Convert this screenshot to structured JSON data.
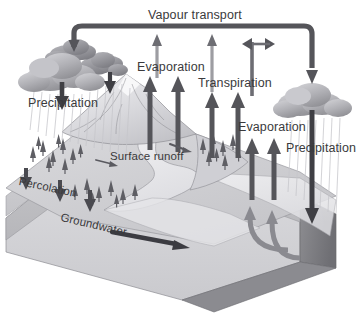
{
  "diagram": {
    "style": "grayscale-3d-block-landscape"
  },
  "labels": {
    "vapour_transport": "Vapour transport",
    "evaporation_left": "Evaporation",
    "transpiration": "Transpiration",
    "precipitation_left": "Precipitation",
    "evaporation_right": "Evaporation",
    "precipitation_right": "Precipitation",
    "surface_runoff": "Surface runoff",
    "percolation": "Percolation",
    "groundwater": "Groundwater"
  },
  "icons": {
    "cloud_left": "cloud-icon",
    "cloud_left_small_a": "cloud-icon",
    "cloud_left_small_b": "cloud-icon",
    "cloud_right": "cloud-icon",
    "mountain": "mountain-icon",
    "trees_left": "tree-cluster-icon",
    "trees_mid": "tree-cluster-icon",
    "trees_right": "tree-cluster-icon",
    "river": "river-icon",
    "terrain_block": "terrain-block-icon",
    "arrow_vapour_transport": "arrow-curved-right-icon",
    "arrow_evaporation_up_a": "arrow-up-icon",
    "arrow_evaporation_up_b": "arrow-up-icon",
    "arrow_transpiration_up_a": "arrow-up-icon",
    "arrow_transpiration_up_b": "arrow-up-icon",
    "arrow_exchange_bidirectional": "arrow-left-right-icon",
    "arrow_precipitation_down_a": "arrow-down-icon",
    "arrow_precipitation_down_b": "arrow-down-icon",
    "arrow_precipitation_down_right": "arrow-down-icon",
    "arrow_percolation_a": "arrow-down-icon",
    "arrow_percolation_b": "arrow-down-icon",
    "arrow_percolation_c": "arrow-down-icon",
    "arrow_groundwater_flow": "arrow-right-icon",
    "arrow_return_curve_a": "arrow-curved-up-icon",
    "arrow_return_curve_b": "arrow-curved-up-icon",
    "rain_streaks_left": "rain-icon",
    "rain_streaks_right": "rain-icon"
  },
  "colors": {
    "background": "#ffffff",
    "arrow_dark": "#55555a",
    "arrow_mid": "#7f7f84",
    "arrow_light": "#a9a9ae",
    "cloud_light": "#c9c9cd",
    "cloud_mid": "#a6a6aa",
    "cloud_dark": "#8a8a8e",
    "terrain_top": "#d5d5d8",
    "terrain_face": "#c2c2c6",
    "terrain_side": "#808084",
    "strata_a": "#cdcdd1",
    "strata_b": "#bcbcc0",
    "water": "#e8e8ea",
    "text": "#3a3a3c",
    "outline": "#6e6e72"
  },
  "flows": [
    {
      "name": "evaporation",
      "direction": "up",
      "from": "ocean-and-land",
      "to": "atmosphere"
    },
    {
      "name": "transpiration",
      "direction": "up",
      "from": "vegetation",
      "to": "atmosphere"
    },
    {
      "name": "vapour-transport",
      "direction": "horizontal",
      "from": "right-atmosphere",
      "to": "left-atmosphere"
    },
    {
      "name": "precipitation",
      "direction": "down",
      "from": "clouds",
      "to": "land-and-ocean"
    },
    {
      "name": "surface-runoff",
      "direction": "lateral",
      "from": "land",
      "to": "ocean"
    },
    {
      "name": "percolation",
      "direction": "down",
      "from": "surface",
      "to": "subsurface"
    },
    {
      "name": "groundwater",
      "direction": "lateral",
      "from": "subsurface",
      "to": "ocean"
    }
  ]
}
